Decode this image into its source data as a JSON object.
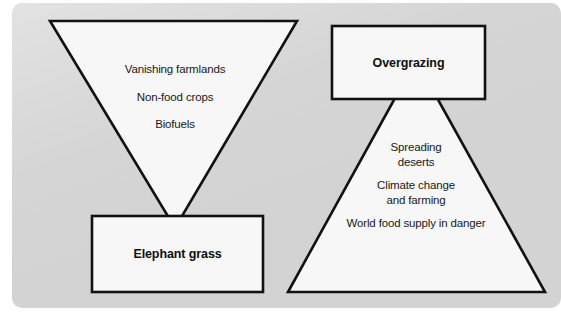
{
  "figure": {
    "background_color": "#ffffff",
    "panel_color": "#d3d3d3",
    "shape_fill_color": "#f7f7f7",
    "shape_stroke_color": "#111111"
  },
  "left_group": {
    "name": "elephant-grass-funnel",
    "triangle": {
      "orientation": "inverted",
      "lines": [
        "Vanishing farmlands",
        "Non-food crops",
        "Biofuels"
      ]
    },
    "box": {
      "label": "Elephant grass"
    }
  },
  "right_group": {
    "name": "overgrazing-pyramid",
    "box": {
      "label": "Overgrazing"
    },
    "triangle": {
      "orientation": "upright",
      "lines": [
        "Spreading",
        "deserts",
        "Climate change",
        "and farming",
        "World food supply in danger"
      ]
    }
  }
}
